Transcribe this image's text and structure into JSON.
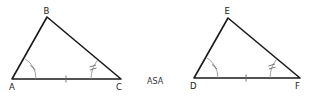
{
  "figure": {
    "caption": "ASA",
    "triangles": [
      {
        "name": "triangle-abc",
        "vertices": [
          {
            "label": "A",
            "x": 12,
            "y": 79
          },
          {
            "label": "B",
            "x": 47,
            "y": 17
          },
          {
            "label": "C",
            "x": 121,
            "y": 79
          }
        ],
        "markings": {
          "angle_single": "A",
          "angle_double": "C",
          "side_single": "AC"
        }
      },
      {
        "name": "triangle-def",
        "vertices": [
          {
            "label": "D",
            "x": 194,
            "y": 78
          },
          {
            "label": "E",
            "x": 228,
            "y": 18
          },
          {
            "label": "F",
            "x": 300,
            "y": 78
          }
        ],
        "markings": {
          "angle_single": "D",
          "angle_double": "F",
          "side_single": "DF"
        }
      }
    ],
    "colors": {
      "edge": "#1a1a1a",
      "marks": "#8a8a8a",
      "background": "#ffffff"
    }
  }
}
